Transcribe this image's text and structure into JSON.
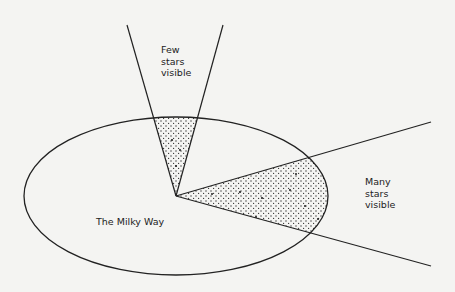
{
  "diagram": {
    "galaxy_label": "The Milky Way",
    "up_cone_label": [
      "Few",
      "stars",
      "visible"
    ],
    "side_cone_label": [
      "Many",
      "stars",
      "visible"
    ],
    "colors": {
      "background": "#f4f4f2",
      "line": "#222222",
      "stipple": "#333333"
    }
  }
}
